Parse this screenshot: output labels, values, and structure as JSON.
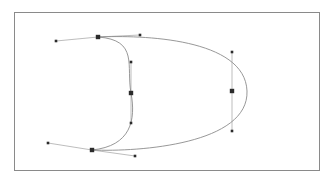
{
  "app": {
    "title": "Bezier Path Editor Canvas",
    "tool": "node-editor"
  },
  "canvas": {
    "width": 335,
    "height": 183,
    "background_color": "#ffffff",
    "frame": {
      "x": 14,
      "y": 12,
      "width": 306,
      "height": 159,
      "border_color": "#8a8a8a",
      "border_width": 1,
      "fill_color": "#ffffff"
    }
  },
  "style": {
    "path_stroke_color": "#8c8c8c",
    "path_stroke_width": 0.9,
    "path_fill": "none",
    "handle_line_color": "#a0a0a0",
    "handle_line_width": 0.7,
    "anchor_fill_color": "#2b2b2b",
    "anchor_stroke_color": "#2b2b2b",
    "anchor_size": 4.4,
    "handle_point_fill_color": "#2b2b2b",
    "handle_point_size": 2.6
  },
  "path": {
    "name": "closed-bezier-path",
    "closed": true,
    "d": "M 98 37 C 142 35 245 38 247 91 C 249 144 140 152 92 150 C 131 146 136 120 131 93 C 126 66 139 40 98 37 Z"
  },
  "nodes": [
    {
      "id": "node-top",
      "label": "Top anchor node",
      "type": "smooth",
      "anchor": {
        "x": 98,
        "y": 37
      },
      "handle_in": {
        "x": 56,
        "y": 41
      },
      "handle_out": {
        "x": 140,
        "y": 35
      },
      "selected": true
    },
    {
      "id": "node-right",
      "label": "Right anchor node",
      "type": "smooth",
      "anchor": {
        "x": 232,
        "y": 91
      },
      "handle_in": {
        "x": 232,
        "y": 52
      },
      "handle_out": {
        "x": 232,
        "y": 131
      },
      "selected": true
    },
    {
      "id": "node-bottom-left",
      "label": "Bottom-left anchor node",
      "type": "smooth",
      "anchor": {
        "x": 92,
        "y": 150
      },
      "handle_in": {
        "x": 135,
        "y": 156
      },
      "handle_out": {
        "x": 48,
        "y": 143
      },
      "selected": true
    },
    {
      "id": "node-middle",
      "label": "Middle cusp anchor node",
      "type": "smooth",
      "anchor": {
        "x": 131,
        "y": 93
      },
      "handle_in": {
        "x": 131,
        "y": 62
      },
      "handle_out": {
        "x": 131,
        "y": 123
      },
      "selected": true
    }
  ],
  "a11y": {
    "canvas_description": "Vector editing canvas with a closed bezier path shaped like a reversed D, four selected anchor nodes each showing two control handles."
  }
}
